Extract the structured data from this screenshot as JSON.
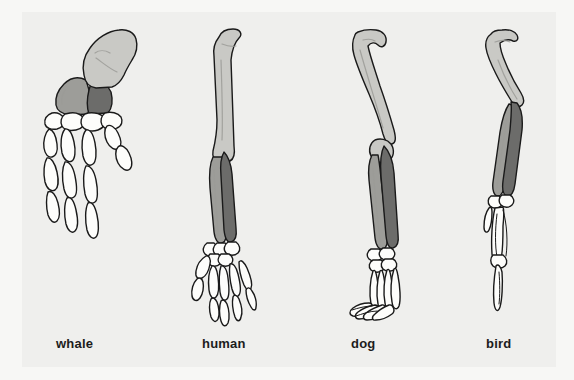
{
  "figure": {
    "background_color": "#f7f7f5",
    "panel_color": "#efefed"
  },
  "legend_colors": {
    "humerus": "#c9c9c5",
    "radius": "#9d9d99",
    "ulna": "#6c6c6a",
    "hand_bones": "#fdfdfb",
    "outline": "#1a1a1a"
  },
  "specimens": [
    {
      "id": "whale",
      "label": "whale",
      "limb": "flipper",
      "bones": [
        {
          "name": "humerus",
          "color": "#c9c9c5"
        },
        {
          "name": "radius",
          "color": "#9d9d99"
        },
        {
          "name": "ulna",
          "color": "#6c6c6a"
        },
        {
          "name": "carpals-metacarpals-phalanges",
          "color": "#fdfdfb"
        }
      ],
      "digit_count": 4
    },
    {
      "id": "human",
      "label": "human",
      "limb": "arm",
      "bones": [
        {
          "name": "humerus",
          "color": "#c9c9c5"
        },
        {
          "name": "radius",
          "color": "#9d9d99"
        },
        {
          "name": "ulna",
          "color": "#6c6c6a"
        },
        {
          "name": "carpals-metacarpals-phalanges",
          "color": "#fdfdfb"
        }
      ],
      "digit_count": 5
    },
    {
      "id": "dog",
      "label": "dog",
      "limb": "foreleg",
      "bones": [
        {
          "name": "humerus",
          "color": "#c9c9c5"
        },
        {
          "name": "radius",
          "color": "#9d9d99"
        },
        {
          "name": "ulna",
          "color": "#6c6c6a"
        },
        {
          "name": "carpals-metacarpals-phalanges",
          "color": "#fdfdfb"
        }
      ],
      "digit_count": 4
    },
    {
      "id": "bird",
      "label": "bird",
      "limb": "wing",
      "bones": [
        {
          "name": "humerus",
          "color": "#c9c9c5"
        },
        {
          "name": "radius",
          "color": "#9d9d99"
        },
        {
          "name": "ulna",
          "color": "#6c6c6a"
        },
        {
          "name": "carpometacarpus-phalanges",
          "color": "#fdfdfb"
        }
      ],
      "digit_count": 3
    }
  ]
}
